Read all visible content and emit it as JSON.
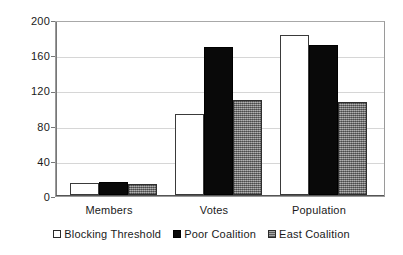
{
  "chart_data": {
    "type": "bar",
    "title": "",
    "subtitle": "",
    "xlabel": "",
    "ylabel": "",
    "categories": [
      "Members",
      "Votes",
      "Population"
    ],
    "series": [
      {
        "name": "Blocking Threshold",
        "values": [
          14,
          92,
          183
        ],
        "color": "#ffffff",
        "style": "white-outline"
      },
      {
        "name": "Poor Coalition",
        "values": [
          15,
          169,
          171
        ],
        "color": "#000000",
        "style": "solid-black"
      },
      {
        "name": "East Coalition",
        "values": [
          12,
          108,
          106
        ],
        "color": "#808080",
        "style": "dithered-gray"
      }
    ],
    "ylim": [
      0,
      200
    ],
    "yticks": [
      0,
      40,
      80,
      120,
      160,
      200
    ],
    "ytick_labels": [
      "0",
      "40",
      "80",
      "120",
      "160",
      "200"
    ],
    "grid": true,
    "grid_axis": "y",
    "legend": true,
    "legend_position": "bottom-center"
  },
  "colors": {
    "plot_background": "#ffffff",
    "gridline": "#d6d6d6",
    "axis": "#777777",
    "text": "#1a1a1a",
    "series_blocking_threshold": "#ffffff",
    "series_poor_coalition": "#000000",
    "series_east_coalition": "#808080"
  }
}
